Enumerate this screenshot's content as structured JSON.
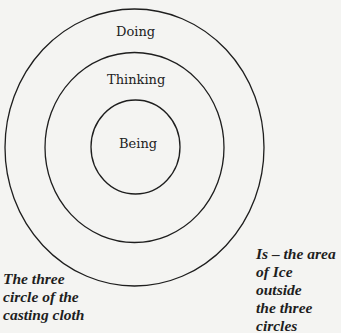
{
  "diagram": {
    "circles": [
      {
        "name": "outer",
        "label": "Doing"
      },
      {
        "name": "middle",
        "label": "Thinking"
      },
      {
        "name": "inner",
        "label": "Being"
      }
    ],
    "caption_left": [
      "The three",
      "circle of the",
      "casting cloth"
    ],
    "caption_right": [
      "Is – the area",
      "of Ice outside",
      "the three",
      "circles"
    ],
    "stroke_color": "#1e1e1e",
    "background_color": "#f4f4f2"
  }
}
